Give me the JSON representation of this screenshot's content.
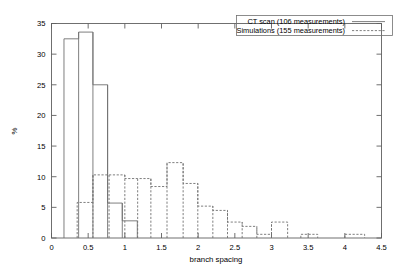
{
  "chart_data": {
    "type": "bar",
    "title": "",
    "subtitle": "",
    "xlabel": "branch spacing",
    "ylabel": "%",
    "xlim": [
      0,
      4.5
    ],
    "ylim": [
      0,
      35
    ],
    "grid": false,
    "legend_position": "top-right",
    "xticks": [
      "0",
      "0.5",
      "1",
      "1.5",
      "2",
      "2.5",
      "3",
      "3.5",
      "4",
      "4.5"
    ],
    "xtick_values": [
      0,
      0.5,
      1,
      1.5,
      2,
      2.5,
      3,
      3.5,
      4,
      4.5
    ],
    "yticks": [
      "0",
      "5",
      "10",
      "15",
      "20",
      "25",
      "30",
      "35"
    ],
    "ytick_values": [
      0,
      5,
      10,
      15,
      20,
      25,
      30,
      35
    ],
    "series": [
      {
        "name": "CT scan (106 measurements)",
        "style": "solid",
        "color": "#707070",
        "bins": [
          {
            "x0": 0.17,
            "x1": 0.37,
            "value": 32.5
          },
          {
            "x0": 0.37,
            "x1": 0.565,
            "value": 33.6
          },
          {
            "x0": 0.565,
            "x1": 0.765,
            "value": 25.0
          },
          {
            "x0": 0.765,
            "x1": 0.965,
            "value": 5.7
          },
          {
            "x0": 0.965,
            "x1": 1.17,
            "value": 2.8
          }
        ]
      },
      {
        "name": "Simulations (155 measurements)",
        "style": "dashed",
        "color": "#707070",
        "bins": [
          {
            "x0": 0.35,
            "x1": 0.565,
            "value": 5.8
          },
          {
            "x0": 0.565,
            "x1": 0.785,
            "value": 10.3
          },
          {
            "x0": 0.785,
            "x1": 1.0,
            "value": 10.3
          },
          {
            "x0": 1.0,
            "x1": 1.175,
            "value": 9.7
          },
          {
            "x0": 1.175,
            "x1": 1.355,
            "value": 9.7
          },
          {
            "x0": 1.355,
            "x1": 1.575,
            "value": 8.4
          },
          {
            "x0": 1.575,
            "x1": 1.795,
            "value": 12.3
          },
          {
            "x0": 1.795,
            "x1": 1.995,
            "value": 8.9
          },
          {
            "x0": 1.995,
            "x1": 2.2,
            "value": 5.2
          },
          {
            "x0": 2.2,
            "x1": 2.4,
            "value": 4.5
          },
          {
            "x0": 2.4,
            "x1": 2.6,
            "value": 2.6
          },
          {
            "x0": 2.6,
            "x1": 2.8,
            "value": 1.9
          },
          {
            "x0": 2.8,
            "x1": 3.0,
            "value": 0.6
          },
          {
            "x0": 3.0,
            "x1": 3.22,
            "value": 2.6
          },
          {
            "x0": 3.4,
            "x1": 3.63,
            "value": 0.6
          },
          {
            "x0": 4.0,
            "x1": 4.27,
            "value": 0.6
          }
        ]
      }
    ]
  },
  "legend": {
    "entries": [
      {
        "label": "CT scan (106 measurements)",
        "style": "solid"
      },
      {
        "label": "Simulations (155 measurements)",
        "style": "dashed"
      }
    ]
  },
  "axes": {
    "x_title": "branch spacing",
    "y_title": "%"
  }
}
